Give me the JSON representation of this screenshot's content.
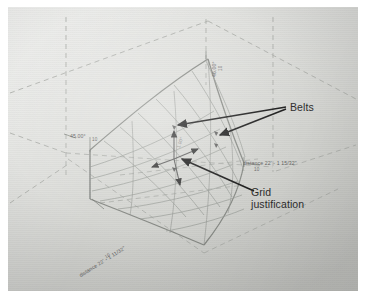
{
  "image": {
    "subject": "CAD drawing photograph of a curved gridshell surface",
    "background_color": "#d9dad6",
    "border_color": "#ffffff",
    "line_color": "#8a8d88",
    "dashed_color": "#a8aaa6",
    "callout_color": "#1a1a1a"
  },
  "callouts": [
    {
      "id": "belts",
      "label": "Belts",
      "x": 287,
      "y": 100,
      "arrows": 2
    },
    {
      "id": "grid-justification",
      "label_line1": "Grid",
      "label_line2": "justification",
      "x": 249,
      "y": 186,
      "arrows": 1
    }
  ],
  "dimensions": [
    {
      "id": "angle-top",
      "text": "46.00°",
      "value": "10",
      "orientation": "vertical",
      "x": 206,
      "y": 62
    },
    {
      "id": "angle-left",
      "text": "45.00°",
      "value": "10",
      "orientation": "horizontal",
      "x": 78,
      "y": 131
    },
    {
      "id": "distance-right",
      "text": "distance 22' - 1 15/32\"",
      "value": "10",
      "orientation": "horizontal",
      "x": 240,
      "y": 157
    },
    {
      "id": "distance-bottom-left",
      "text": "distance 22' - 1 11/32\"",
      "value": "10",
      "orientation": "rotated",
      "rotation": -32,
      "x": 78,
      "y": 276
    },
    {
      "id": "grid-center-value",
      "text": "1.00°",
      "orientation": "rotated",
      "rotation": -72,
      "x": 176,
      "y": 144
    }
  ],
  "geometry": {
    "surface_name": "hyperbolic gridshell surface",
    "grid_rows": 7,
    "grid_cols": 7,
    "marker_count": 4,
    "construction_box": "isometric dashed bounding lines"
  }
}
